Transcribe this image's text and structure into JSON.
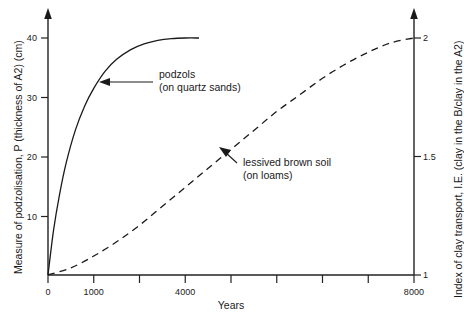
{
  "chart_data": {
    "type": "line",
    "title": "",
    "xlabel": "Years",
    "ylabel_left": "Measure of podzolisation, P (thickness of A2) (cm)",
    "ylabel_right": "Index of clay transport, I.E. (clay in the B/clay in the A2)",
    "xlim": [
      0,
      8000
    ],
    "ylim_left": [
      0,
      44
    ],
    "ylim_right": [
      1,
      2.25
    ],
    "grid": false,
    "legend": "none",
    "x_ticks_major": [
      0,
      1000,
      4000,
      8000
    ],
    "x_tick_labels": [
      "0",
      "1000",
      "4000",
      "8000"
    ],
    "x_ticks_minor": [
      2000,
      3000,
      5000,
      6000,
      7000
    ],
    "y_left_ticks": [
      10,
      20,
      30,
      40
    ],
    "y_left_tick_labels": [
      "10",
      "20",
      "30",
      "40"
    ],
    "y_right_ticks": [
      1,
      1.5,
      2
    ],
    "y_right_tick_labels": [
      "1",
      "1.5",
      "2"
    ],
    "series": [
      {
        "name": "podzols (on quartz sands)",
        "style": "solid",
        "axis": "left",
        "x": [
          0,
          120,
          250,
          400,
          600,
          800,
          1000,
          1250,
          1500,
          1800,
          2100,
          2400,
          2700,
          3000,
          3300
        ],
        "y": [
          0,
          7.5,
          13.5,
          19.0,
          24.5,
          28.5,
          31.5,
          34.4,
          36.4,
          38.0,
          39.0,
          39.6,
          39.9,
          40.0,
          40.0
        ]
      },
      {
        "name": "lessived brown soil (on loams)",
        "style": "dashed",
        "axis": "right",
        "x": [
          0,
          500,
          1000,
          1500,
          2000,
          2500,
          3000,
          3500,
          4000,
          4500,
          5000,
          5500,
          6000,
          6500,
          7000,
          7500,
          8000
        ],
        "y": [
          1.0,
          1.03,
          1.08,
          1.14,
          1.21,
          1.29,
          1.37,
          1.45,
          1.53,
          1.61,
          1.69,
          1.76,
          1.83,
          1.89,
          1.94,
          1.98,
          2.0
        ]
      }
    ],
    "annotations": [
      {
        "id": "podzols",
        "line1": "podzols",
        "line2": "(on quartz sands)",
        "points_to_x": 1150,
        "points_to_y_left": 33.2
      },
      {
        "id": "lessived",
        "line1": "lessived brown soil",
        "line2": "(on loams)",
        "points_to_x": 4050,
        "points_to_y_right": 1.52
      }
    ]
  }
}
